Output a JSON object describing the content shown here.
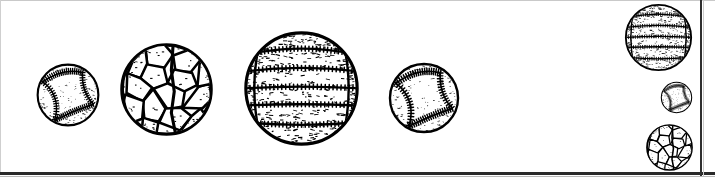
{
  "image": {
    "kind": "line-art-illustration",
    "subject": "sports balls",
    "style": "black-and-white clipart, stippled ink drawing",
    "background_color": "#ffffff",
    "ink_color": "#000000",
    "width": 715,
    "height": 184
  },
  "borders": {
    "top_rule_color": "#c9c9c9",
    "left_rule_color": "#cfcfcf",
    "bottom_rule_color": "#2a2a2a",
    "right_rule_color": "#2f2f2f"
  },
  "balls": [
    {
      "id": "baseball-large-left",
      "label": "Baseball",
      "type": "baseball",
      "group": "main-row",
      "order": 1,
      "cx": 68,
      "cy": 95,
      "diameter": 66,
      "texture": "stitched seams with speckle"
    },
    {
      "id": "soccer-ball-large",
      "label": "Soccer ball",
      "type": "soccer",
      "group": "main-row",
      "order": 2,
      "cx": 166,
      "cy": 89,
      "diameter": 97,
      "texture": "pentagon and hexagon panels"
    },
    {
      "id": "volleyball-large",
      "label": "Volleyball",
      "type": "volleyball",
      "group": "main-row",
      "order": 3,
      "cx": 301,
      "cy": 88,
      "diameter": 121,
      "texture": "banded panels with heavy stipple"
    },
    {
      "id": "baseball-medium-right",
      "label": "Baseball",
      "type": "baseball",
      "group": "main-row",
      "order": 4,
      "cx": 424,
      "cy": 98,
      "diameter": 74,
      "texture": "stitched seams with speckle"
    },
    {
      "id": "volleyball-column-top",
      "label": "Volleyball",
      "type": "volleyball",
      "group": "right-column",
      "order": 1,
      "cx": 658,
      "cy": 37,
      "diameter": 71,
      "texture": "banded panels with heavy stipple"
    },
    {
      "id": "baseball-column-middle",
      "label": "Baseball",
      "type": "baseball",
      "group": "right-column",
      "order": 2,
      "cx": 676,
      "cy": 97,
      "diameter": 33,
      "texture": "stitched seams with speckle"
    },
    {
      "id": "soccer-ball-column-bottom",
      "label": "Soccer ball",
      "type": "soccer",
      "group": "right-column",
      "order": 3,
      "cx": 669,
      "cy": 147,
      "diameter": 49,
      "texture": "pentagon and hexagon panels"
    }
  ]
}
